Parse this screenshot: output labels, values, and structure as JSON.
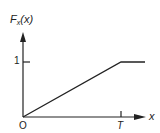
{
  "figure": {
    "y_axis_label": "F",
    "y_axis_label_sub": "x",
    "y_axis_label_arg": "(x)",
    "x_axis_label": "x",
    "origin_label": "O",
    "y_tick_label": "1",
    "x_tick_label": "T"
  },
  "colors": {
    "line": "#222222",
    "background": "#ffffff"
  }
}
